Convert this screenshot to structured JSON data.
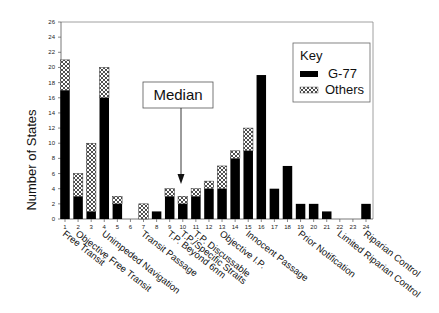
{
  "chart_data": {
    "type": "bar",
    "stacked": true,
    "title": "",
    "xlabel": "",
    "ylabel": "Number of States",
    "ylim": [
      0,
      26
    ],
    "yticks": [
      0,
      2,
      4,
      6,
      8,
      10,
      12,
      14,
      16,
      18,
      20,
      22,
      24,
      26
    ],
    "grid": false,
    "legend_position": "upper right",
    "legend_title": "Key",
    "categories": [
      "1",
      "2",
      "3",
      "4",
      "5",
      "6",
      "7",
      "8",
      "9",
      "10",
      "11",
      "12",
      "13",
      "14",
      "15",
      "16",
      "17",
      "18",
      "19",
      "20",
      "21",
      "22",
      "23",
      "24"
    ],
    "series": [
      {
        "name": "G-77",
        "fill": "solid-black",
        "values": [
          17,
          3,
          1,
          16,
          2,
          0,
          0,
          1,
          3,
          2,
          3,
          4,
          4,
          8,
          9,
          19,
          4,
          7,
          2,
          2,
          1,
          0,
          0,
          2
        ]
      },
      {
        "name": "Others",
        "fill": "crosshatch",
        "values": [
          4,
          3,
          9,
          4,
          1,
          0,
          2,
          0,
          1,
          1,
          1,
          1,
          3,
          1,
          3,
          0,
          0,
          0,
          0,
          0,
          0,
          0,
          0,
          0
        ]
      }
    ],
    "category_labels": [
      {
        "index": 1,
        "text": "Free Transit"
      },
      {
        "index": 2,
        "text": "Objective Free Transit"
      },
      {
        "index": 4,
        "text": "Unimpeded Navigation"
      },
      {
        "index": 7,
        "text": "Transit Passage"
      },
      {
        "index": 9,
        "text": "T.P. Beyond 6nm"
      },
      {
        "index": 10,
        "text": "T.P./Specific Straits"
      },
      {
        "index": 11,
        "text": "T.P. Discussable"
      },
      {
        "index": 13,
        "text": "Objective I.P."
      },
      {
        "index": 15,
        "text": "Innocent Passage"
      },
      {
        "index": 19,
        "text": "Prior Notification"
      },
      {
        "index": 22,
        "text": "Limited Riparian Control"
      },
      {
        "index": 24,
        "text": "Riparian Control"
      }
    ],
    "annotations": [
      {
        "text": "Median",
        "points_to_category": "10"
      }
    ]
  },
  "legend": {
    "title": "Key",
    "items": [
      {
        "label": "G-77",
        "fill": "solid-black"
      },
      {
        "label": "Others",
        "fill": "crosshatch"
      }
    ]
  },
  "annotation": {
    "median_label": "Median"
  },
  "axis": {
    "y_label": "Number of States"
  }
}
